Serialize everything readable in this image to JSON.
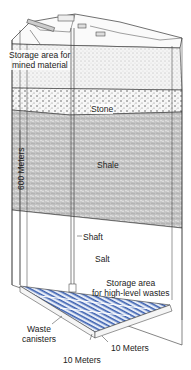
{
  "diagram": {
    "title": "",
    "colors": {
      "line": "#333333",
      "stipple": "#777777",
      "shale": "#bdbdbd",
      "storage_blue": "#3a5fb0",
      "storage_light": "#dfe6f3",
      "background": "#ffffff"
    },
    "labels": {
      "storage_mined_line1": "Storage area for",
      "storage_mined_line2": "mined material",
      "stone": "Stone",
      "shale": "Shale",
      "depth": "600 Meters",
      "shaft": "Shaft",
      "salt": "Salt",
      "storage_hlw_line1": "Storage area",
      "storage_hlw_line2": "for high-level wastes",
      "waste_line1": "Waste",
      "waste_line2": "canisters",
      "dim_a": "10 Meters",
      "dim_b": "10 Meters"
    },
    "layers": [
      {
        "name": "Surface",
        "top": 40
      },
      {
        "name": "Upper stipple",
        "top": 40
      },
      {
        "name": "Stone",
        "top": 90
      },
      {
        "name": "Shale",
        "top": 112
      },
      {
        "name": "Salt",
        "top": 220
      }
    ]
  }
}
